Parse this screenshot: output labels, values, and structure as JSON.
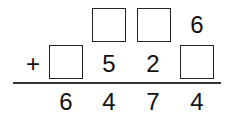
{
  "problem": {
    "operator": "+",
    "row1": [
      "",
      "blank",
      "blank",
      "6"
    ],
    "row2": [
      "blank",
      "5",
      "2",
      "blank"
    ],
    "result": [
      "6",
      "4",
      "7",
      "4"
    ]
  },
  "labels": {
    "plus": "+",
    "r1c4": "6",
    "r2c2": "5",
    "r2c3": "2",
    "res1": "6",
    "res2": "4",
    "res3": "7",
    "res4": "4"
  }
}
